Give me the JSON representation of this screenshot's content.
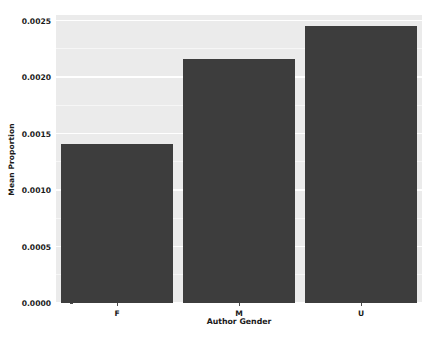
{
  "chart_data": {
    "type": "bar",
    "title": "",
    "subtitle": "",
    "xlabel": "Author Gender",
    "ylabel": "Mean Proportion",
    "categories": [
      "F",
      "M",
      "U"
    ],
    "values": [
      0.00141,
      0.00216,
      0.00245
    ],
    "series": [
      {
        "name": "Mean Proportion",
        "values": [
          0.00141,
          0.00216,
          0.00245
        ]
      }
    ],
    "ylim": [
      0.0,
      0.00255
    ],
    "xtick_labels": [
      "F",
      "M",
      "U"
    ],
    "ytick_labels": [
      "0.0000",
      "0.0005",
      "0.0010",
      "0.0015",
      "0.0020",
      "0.0025"
    ],
    "ytick_values": [
      0.0,
      0.0005,
      0.001,
      0.0015,
      0.002,
      0.0025
    ],
    "grid": true,
    "legend": "none",
    "bar_color": "#3d3d3d",
    "panel_background": "#ebebeb",
    "gridline_color": "#ffffff",
    "figure_background": "#ffffff"
  }
}
